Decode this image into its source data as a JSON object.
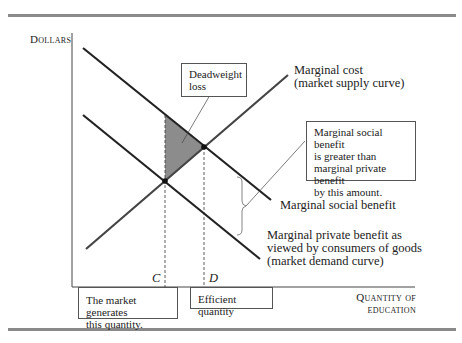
{
  "axes": {
    "y_label": "Dollars",
    "x_label_line1": "Quantity of",
    "x_label_line2": "education"
  },
  "curves": {
    "marginal_cost_line1": "Marginal cost",
    "marginal_cost_line2": "(market supply curve)",
    "msb": "Marginal social benefit",
    "mpb_line1": "Marginal private benefit as",
    "mpb_line2": "viewed by consumers of goods",
    "mpb_line3": "(market demand curve)"
  },
  "points": {
    "c": "C",
    "d": "D"
  },
  "callouts": {
    "deadweight_line1": "Deadweight",
    "deadweight_line2": "loss",
    "gap_line1": "Marginal social benefit",
    "gap_line2": "is greater than",
    "gap_line3": "marginal private benefit",
    "gap_line4": "by this amount.",
    "market_line1": "The market generates",
    "market_line2": "this quantity.",
    "efficient": "Efficient quantity"
  },
  "colors": {
    "curve": "#222222",
    "supply": "#444444",
    "deadweight_fill": "#8c8c8c",
    "rule": "#8a8a8a"
  }
}
